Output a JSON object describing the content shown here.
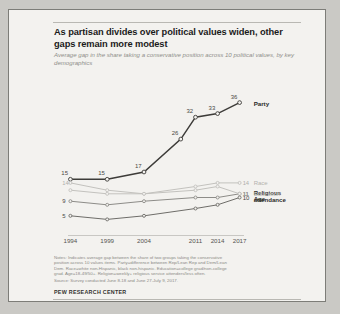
{
  "card": {
    "title": "As partisan divides over political values widen, other gaps remain more modest",
    "subtitle": "Average gap in the share taking a conservative position across 10 political values, by key demographics",
    "footer": "PEW RESEARCH CENTER",
    "notes": [
      "Notes: Indicates average gap between the share of two groups taking the conservative",
      "position across 10 values items. Party=difference between Rep/Lean Rep and Dem/Lean",
      "Dem. Race=white non-Hispanic, black non-hispanic. Education=college grad/non-college",
      "grad. Age=18-49/50+. Religion=weekly+ religious service attenders/less often."
    ],
    "source": "Source: Survey conducted June 8-18 and June 27-July 9, 2017."
  },
  "chart_data": {
    "type": "line",
    "title": "As partisan divides over political values widen, other gaps remain more modest",
    "subtitle": "Average gap in the share taking a conservative position across 10 political values, by key demographics",
    "xlabel": "",
    "ylabel": "",
    "categories": [
      "1994",
      "1999",
      "2004",
      "2011",
      "2014",
      "2017"
    ],
    "x": [
      1994,
      1999,
      2004,
      2011,
      2014,
      2017
    ],
    "xlim": [
      1993,
      2018
    ],
    "ylim": [
      0,
      40
    ],
    "grid": false,
    "legend_position": "right-inline",
    "series": [
      {
        "name": "Party",
        "color": "#3d3c39",
        "emphasis": "strong",
        "x": [
          1994,
          1999,
          2004,
          2009,
          2011,
          2014,
          2017
        ],
        "values": [
          15,
          15,
          17,
          26,
          32,
          33,
          36
        ],
        "point_labels": [
          "15",
          "15",
          "17",
          "26",
          "32",
          "33",
          "36"
        ],
        "end_label": "Party",
        "end_value": "36"
      },
      {
        "name": "Race",
        "color": "#c3c2be",
        "emphasis": "faint",
        "x": [
          1994,
          1999,
          2004,
          2011,
          2014,
          2017
        ],
        "values": [
          14,
          12,
          11,
          13,
          14,
          14
        ],
        "start_value": "14",
        "end_value": "14",
        "end_label": "Race"
      },
      {
        "name": "Religious attendance",
        "color": "#8d8c88",
        "emphasis": "medium",
        "x": [
          1994,
          1999,
          2004,
          2011,
          2014,
          2017
        ],
        "values": [
          9,
          8,
          9,
          10,
          10,
          11
        ],
        "start_value": "9",
        "end_value": "11",
        "end_label": "Religious attendance"
      },
      {
        "name": "Education",
        "color": "#c3c2be",
        "emphasis": "faint",
        "x": [
          1994,
          1999,
          2004,
          2011,
          2014,
          2017
        ],
        "values": [
          12,
          11,
          11,
          12,
          13,
          11
        ],
        "start_value": "",
        "end_value": "11",
        "end_label": "Education"
      },
      {
        "name": "Age",
        "color": "#6e6d69",
        "emphasis": "medium",
        "x": [
          1994,
          1999,
          2004,
          2011,
          2014,
          2017
        ],
        "values": [
          5,
          4,
          5,
          7,
          8,
          10
        ],
        "start_value": "5",
        "end_value": "10",
        "end_label": "Age"
      }
    ]
  }
}
